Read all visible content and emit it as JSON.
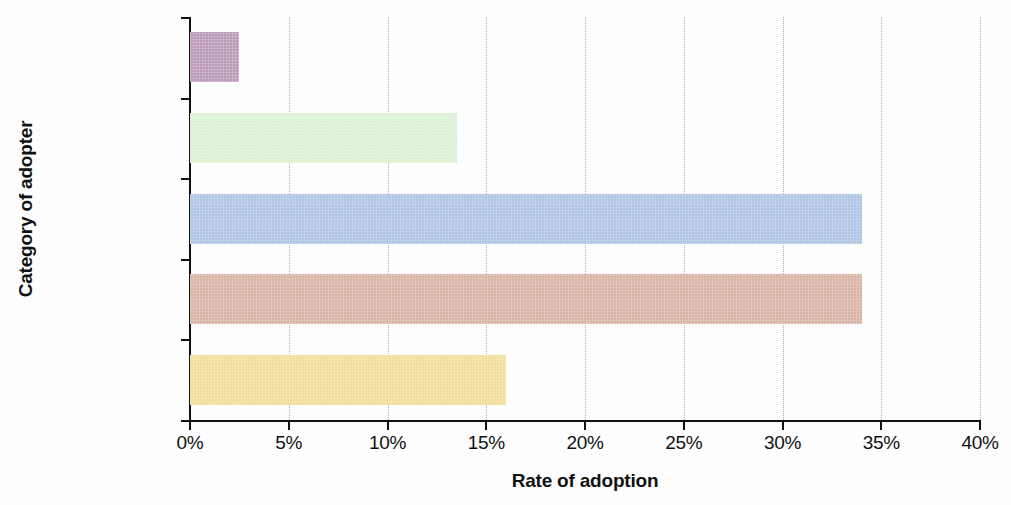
{
  "chart_data": {
    "type": "bar",
    "orientation": "horizontal",
    "title": "",
    "xlabel": "Rate of adoption",
    "ylabel": "Category of adopter",
    "categories": [
      "Innovators",
      "Early adopters",
      "Early majority",
      "Late majority",
      "Laggards"
    ],
    "values": [
      2.5,
      13.5,
      34,
      34,
      16
    ],
    "value_suffix": "%",
    "xlim": [
      0,
      40
    ],
    "xticks": [
      0,
      5,
      10,
      15,
      20,
      25,
      30,
      35,
      40
    ],
    "xtick_labels": [
      "0%",
      "5%",
      "10%",
      "15%",
      "20%",
      "25%",
      "30%",
      "35%",
      "40%"
    ],
    "grid": true,
    "grid_axis": "x",
    "grid_style": "dotted",
    "legend": "none",
    "bar_colors": [
      "#bb9ab8",
      "#dcf0d4",
      "#aec4e7",
      "#d9b2a4",
      "#f1dd97"
    ],
    "series": [
      {
        "name": "Rate of adoption",
        "points": [
          {
            "category": "Innovators",
            "value": 2.5
          },
          {
            "category": "Early adopters",
            "value": 13.5
          },
          {
            "category": "Early majority",
            "value": 34
          },
          {
            "category": "Late majority",
            "value": 34
          },
          {
            "category": "Laggards",
            "value": 16
          }
        ]
      }
    ]
  },
  "axes": {
    "x_title": "Rate of adoption",
    "y_title": "Category of adopter"
  }
}
